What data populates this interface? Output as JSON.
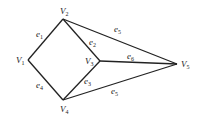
{
  "diagram": {
    "type": "graph",
    "vertices": [
      {
        "id": "V1",
        "name": "V",
        "sub": "1",
        "x": 28,
        "y": 60,
        "lx": 16,
        "ly": 63
      },
      {
        "id": "V2",
        "name": "V",
        "sub": "2",
        "x": 63,
        "y": 19,
        "lx": 60,
        "ly": 14
      },
      {
        "id": "V3",
        "name": "V",
        "sub": "3",
        "x": 100,
        "y": 61,
        "lx": 85,
        "ly": 64
      },
      {
        "id": "V4",
        "name": "V",
        "sub": "4",
        "x": 63,
        "y": 100,
        "lx": 60,
        "ly": 112
      },
      {
        "id": "V5",
        "name": "V",
        "sub": "5",
        "x": 177,
        "y": 64,
        "lx": 181,
        "ly": 67
      }
    ],
    "edges": [
      {
        "id": "e1",
        "name": "e",
        "sub": "1",
        "from": "V1",
        "to": "V2",
        "lx": 36,
        "ly": 37
      },
      {
        "id": "e2",
        "name": "e",
        "sub": "2",
        "from": "V2",
        "to": "V3",
        "lx": 89,
        "ly": 45
      },
      {
        "id": "e3",
        "name": "e",
        "sub": "3",
        "from": "V3",
        "to": "V4",
        "lx": 84,
        "ly": 84
      },
      {
        "id": "e4",
        "name": "e",
        "sub": "4",
        "from": "V1",
        "to": "V4",
        "lx": 36,
        "ly": 88
      },
      {
        "id": "e5",
        "name": "e",
        "sub": "5",
        "from": "V2",
        "to": "V5",
        "lx": 114,
        "ly": 32
      },
      {
        "id": "e6",
        "name": "e",
        "sub": "6",
        "from": "V3",
        "to": "V5",
        "lx": 127,
        "ly": 59
      },
      {
        "id": "e7",
        "name": "e",
        "sub": "5",
        "from": "V4",
        "to": "V5",
        "lx": 111,
        "ly": 94
      }
    ]
  }
}
